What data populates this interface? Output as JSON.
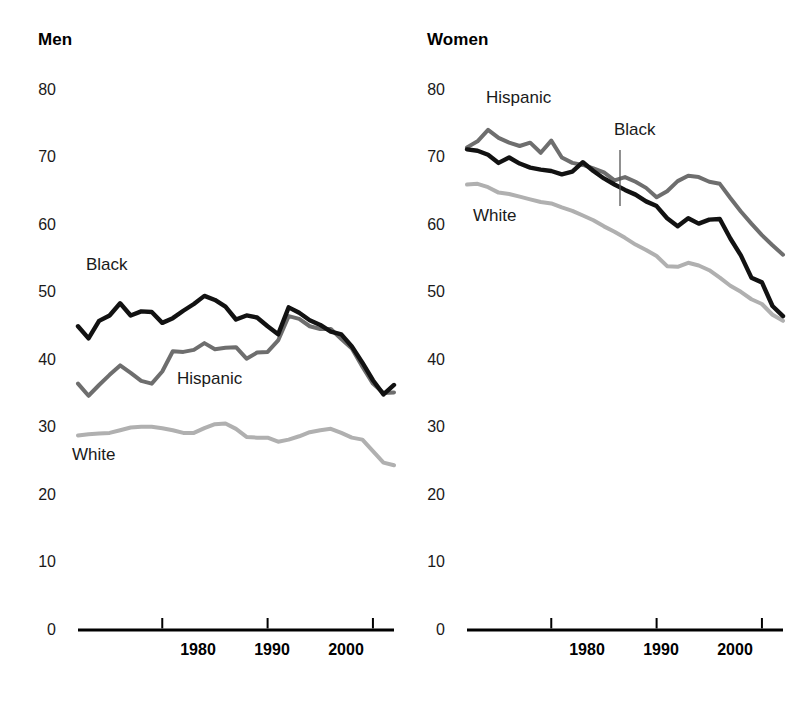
{
  "figure": {
    "background": "#ffffff",
    "colors": {
      "black_series": "#121212",
      "hispanic_series": "#6e6e6e",
      "white_series": "#b0b0b0",
      "axis": "#000000",
      "text": "#1a1a1a"
    }
  },
  "panels": [
    {
      "id": "men",
      "title": "Men"
    },
    {
      "id": "women",
      "title": "Women"
    }
  ],
  "axis": {
    "y_ticks": [
      "80",
      "70",
      "60",
      "50",
      "40",
      "30",
      "20",
      "10",
      "0"
    ],
    "x_ticks": [
      "1980",
      "1990",
      "2000"
    ]
  },
  "labels": {
    "men": {
      "black": "Black",
      "hispanic": "Hispanic",
      "white": "White"
    },
    "women": {
      "black": "Black",
      "hispanic": "Hispanic",
      "white": "White"
    }
  },
  "chart_data": {
    "type": "line",
    "title": "",
    "subtitle": "",
    "xlabel": "",
    "ylabel": "",
    "xlim": [
      1972,
      2002
    ],
    "ylim": [
      0,
      85
    ],
    "y_axis_ticks": [
      0,
      10,
      20,
      30,
      40,
      50,
      60,
      70,
      80
    ],
    "x_axis_ticks": [
      1980,
      1990,
      2000
    ],
    "grid": false,
    "legend": "inline-annotations",
    "panels": [
      {
        "name": "Men",
        "x": [
          1972,
          1973,
          1974,
          1975,
          1976,
          1977,
          1978,
          1979,
          1980,
          1981,
          1982,
          1983,
          1984,
          1985,
          1986,
          1987,
          1988,
          1989,
          1990,
          1991,
          1992,
          1993,
          1994,
          1995,
          1996,
          1997,
          1998,
          1999,
          2000,
          2001,
          2002
        ],
        "series": [
          {
            "name": "Black",
            "color": "#121212",
            "values": [
              45.0,
              43.2,
              45.8,
              46.6,
              48.4,
              46.6,
              47.2,
              47.1,
              45.5,
              46.2,
              47.3,
              48.3,
              49.5,
              48.9,
              47.9,
              46.0,
              46.6,
              46.3,
              45.0,
              43.8,
              47.8,
              47.0,
              45.9,
              45.2,
              44.2,
              43.8,
              42.0,
              39.6,
              37.0,
              34.9,
              36.3
            ]
          },
          {
            "name": "Hispanic",
            "color": "#6e6e6e",
            "values": [
              36.5,
              34.7,
              36.3,
              37.8,
              39.2,
              38.1,
              36.9,
              36.5,
              38.3,
              41.3,
              41.2,
              41.5,
              42.5,
              41.6,
              41.8,
              41.9,
              40.2,
              41.1,
              41.2,
              42.9,
              46.5,
              46.1,
              45.0,
              44.6,
              44.6,
              43.1,
              41.7,
              39.0,
              36.5,
              35.1,
              35.2
            ]
          },
          {
            "name": "White",
            "color": "#b0b0b0",
            "values": [
              28.8,
              29.0,
              29.1,
              29.2,
              29.6,
              30.0,
              30.1,
              30.1,
              29.9,
              29.6,
              29.2,
              29.2,
              29.9,
              30.5,
              30.6,
              29.8,
              28.6,
              28.5,
              28.5,
              27.9,
              28.2,
              28.7,
              29.3,
              29.6,
              29.8,
              29.2,
              28.5,
              28.2,
              26.5,
              24.8,
              24.4
            ]
          }
        ]
      },
      {
        "name": "Women",
        "x": [
          1972,
          1973,
          1974,
          1975,
          1976,
          1977,
          1978,
          1979,
          1980,
          1981,
          1982,
          1983,
          1984,
          1985,
          1986,
          1987,
          1988,
          1989,
          1990,
          1991,
          1992,
          1993,
          1994,
          1995,
          1996,
          1997,
          1998,
          1999,
          2000,
          2001,
          2002
        ],
        "series": [
          {
            "name": "Black",
            "color": "#121212",
            "values": [
              71.2,
              71.0,
              70.4,
              69.2,
              70.0,
              69.1,
              68.5,
              68.2,
              68.0,
              67.5,
              67.9,
              69.3,
              68.0,
              66.9,
              66.0,
              65.2,
              64.5,
              63.5,
              62.8,
              61.0,
              59.8,
              61.0,
              60.2,
              60.8,
              60.9,
              58.0,
              55.5,
              52.2,
              51.5,
              48.0,
              46.5
            ]
          },
          {
            "name": "Hispanic",
            "color": "#6e6e6e",
            "values": [
              71.5,
              72.4,
              74.1,
              72.9,
              72.2,
              71.7,
              72.2,
              70.7,
              72.5,
              70.0,
              69.2,
              68.9,
              68.4,
              67.8,
              66.6,
              67.1,
              66.4,
              65.5,
              64.1,
              65.0,
              66.5,
              67.3,
              67.1,
              66.4,
              66.1,
              64.0,
              62.0,
              60.2,
              58.5,
              57.0,
              55.6
            ]
          },
          {
            "name": "White",
            "color": "#b0b0b0",
            "values": [
              66.0,
              66.1,
              65.6,
              64.8,
              64.6,
              64.2,
              63.8,
              63.4,
              63.2,
              62.6,
              62.1,
              61.4,
              60.7,
              59.8,
              59.0,
              58.1,
              57.1,
              56.3,
              55.4,
              53.9,
              53.8,
              54.4,
              54.0,
              53.3,
              52.2,
              51.0,
              50.1,
              49.0,
              48.3,
              46.7,
              45.8
            ]
          }
        ]
      }
    ]
  }
}
